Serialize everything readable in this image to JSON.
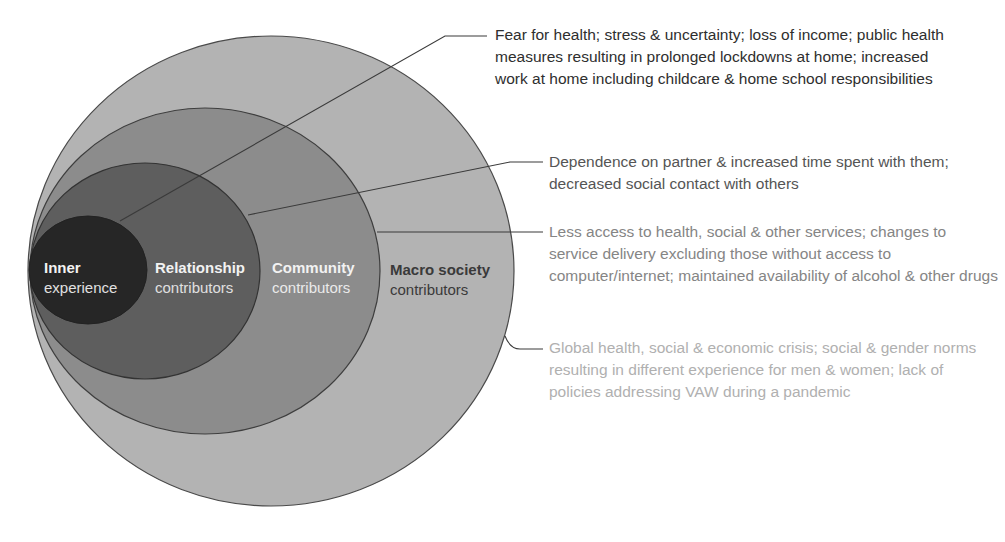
{
  "diagram": {
    "rings": [
      {
        "id": "macro",
        "title": "Macro society",
        "subtitle": "contributors",
        "fill": "#b3b3b3",
        "title_color": "#3a3a3a",
        "sub_color": "#3a3a3a"
      },
      {
        "id": "community",
        "title": "Community",
        "subtitle": "contributors",
        "fill": "#8c8c8c",
        "title_color": "#f2f2f2",
        "sub_color": "#eaeaea"
      },
      {
        "id": "relationship",
        "title": "Relationship",
        "subtitle": "contributors",
        "fill": "#5e5e5e",
        "title_color": "#f2f2f2",
        "sub_color": "#e0e0e0"
      },
      {
        "id": "inner",
        "title": "Inner",
        "subtitle": "experience",
        "fill": "#262626",
        "title_color": "#f2f2f2",
        "sub_color": "#e0e0e0"
      }
    ],
    "annotations": [
      {
        "target": "inner",
        "text": "Fear for health; stress & uncertainty; loss of income; public health measures resulting in prolonged lockdowns at home; increased work at home including childcare & home school responsibilities",
        "color": "#2e2e2e"
      },
      {
        "target": "relationship",
        "text": "Dependence on partner & increased time spent with them; decreased social contact with others",
        "color": "#555555"
      },
      {
        "target": "community",
        "text": "Less access to health, social & other services; changes to service delivery excluding those without access to computer/internet; maintained availability of alcohol & other drugs",
        "color": "#858585"
      },
      {
        "target": "macro",
        "text": "Global health, social & economic crisis; social & gender norms resulting in different experience for men & women; lack of policies addressing VAW during a pandemic",
        "color": "#b0b0b0"
      }
    ],
    "line_color": "#3a3a3a"
  }
}
